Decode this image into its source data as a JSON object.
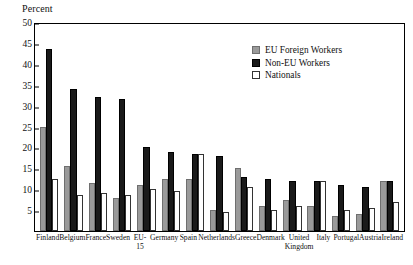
{
  "chart_data": {
    "type": "bar",
    "title": "",
    "xlabel": "",
    "ylabel": "Percent",
    "ylim": [
      0,
      50
    ],
    "yticks": [
      5,
      10,
      15,
      20,
      25,
      30,
      35,
      40,
      45,
      50
    ],
    "grid": false,
    "legend_position": "top-right",
    "categories": [
      "Finland",
      "Belgium",
      "France",
      "Sweden",
      "EU-15",
      "Germany",
      "Spain",
      "Netherlands",
      "Greece",
      "Denmark",
      "United Kingdom",
      "Italy",
      "Portugal",
      "Austria",
      "Ireland"
    ],
    "series": [
      {
        "name": "EU Foreign Workers",
        "color": "#9a9a9a",
        "values": [
          25.0,
          15.5,
          11.5,
          8.0,
          11.0,
          12.5,
          12.5,
          5.0,
          15.0,
          6.0,
          7.5,
          6.0,
          3.5,
          4.0,
          12.0
        ]
      },
      {
        "name": "Non-EU Workers",
        "color": "#1a1a1a",
        "values": [
          43.5,
          34.0,
          32.0,
          31.5,
          20.0,
          19.0,
          18.5,
          18.0,
          13.0,
          12.5,
          12.0,
          12.0,
          11.0,
          10.5,
          12.0
        ]
      },
      {
        "name": "Nationals",
        "color": "#ffffff",
        "values": [
          12.5,
          8.5,
          9.0,
          8.5,
          10.0,
          9.5,
          18.5,
          4.5,
          10.5,
          5.0,
          6.0,
          12.0,
          5.0,
          5.5,
          7.0
        ]
      }
    ]
  },
  "legend": {
    "items": [
      {
        "label": "EU Foreign Workers",
        "swatch": "eu"
      },
      {
        "label": "Non-EU Workers",
        "swatch": "noneu"
      },
      {
        "label": "Nationals",
        "swatch": "nat"
      }
    ]
  }
}
